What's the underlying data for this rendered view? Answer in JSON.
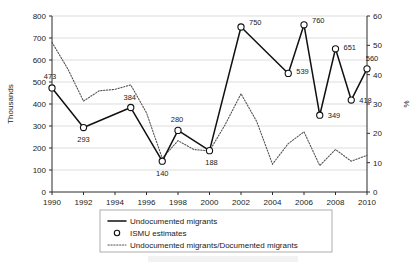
{
  "chart_data": {
    "type": "line",
    "title": "",
    "xlabel": "",
    "ylabel": "Thousands",
    "y2label": "%",
    "xlim": [
      1990,
      2010
    ],
    "ylim": [
      0,
      800
    ],
    "y2lim": [
      0,
      60
    ],
    "grid": true,
    "legend_position": "bottom",
    "x_ticks": [
      1990,
      1992,
      1994,
      1996,
      1998,
      2000,
      2002,
      2004,
      2006,
      2008,
      2010
    ],
    "y_ticks": [
      0,
      100,
      200,
      300,
      400,
      500,
      600,
      700,
      800
    ],
    "y2_ticks": [
      0,
      10,
      20,
      30,
      40,
      50,
      60
    ],
    "series": [
      {
        "name": "Undocumented migrants",
        "style": "solid",
        "axis": "left",
        "x": [
          1990,
          1992,
          1995,
          1997,
          1998,
          2000,
          2002,
          2005,
          2006,
          2007,
          2008,
          2009,
          2010
        ],
        "values": [
          473,
          293,
          384,
          140,
          280,
          188,
          750,
          539,
          760,
          349,
          651,
          418,
          560
        ],
        "labels": [
          "473",
          "293",
          "384",
          "140",
          "280",
          "188",
          "750",
          "539",
          "760",
          "349",
          "651",
          "418",
          "560"
        ]
      },
      {
        "name": "ISMU estimates",
        "style": "marker",
        "axis": "left",
        "marker": "open-circle",
        "x": [
          1990,
          1992,
          1995,
          1997,
          1998,
          2000,
          2002,
          2005,
          2006,
          2007,
          2008,
          2009,
          2010
        ],
        "values": [
          473,
          293,
          384,
          140,
          280,
          188,
          750,
          539,
          760,
          349,
          651,
          418,
          560
        ]
      },
      {
        "name": "Undocumented migrants/Documented migrants",
        "style": "dotted",
        "axis": "right",
        "x": [
          1990,
          1991,
          1992,
          1993,
          1994,
          1995,
          1996,
          1997,
          1998,
          1999,
          2000,
          2001,
          2002,
          2003,
          2004,
          2005,
          2006,
          2007,
          2008,
          2009,
          2010
        ],
        "values": [
          51.0,
          42.0,
          31.0,
          34.5,
          35.0,
          36.5,
          27.0,
          11.5,
          17.5,
          14.5,
          14.0,
          23.0,
          33.5,
          24.0,
          9.5,
          16.5,
          20.5,
          9.0,
          14.5,
          10.5,
          12.5
        ]
      }
    ]
  },
  "legend": {
    "items": [
      {
        "label": "Undocumented migrants",
        "marker": "solid-line"
      },
      {
        "label": "ISMU estimates",
        "marker": "open-circle"
      },
      {
        "label": "Undocumented migrants/Documented migrants",
        "marker": "dotted-line"
      }
    ]
  }
}
